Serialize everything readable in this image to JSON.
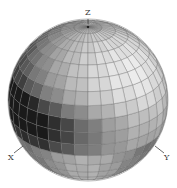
{
  "figure": {
    "type": "shaded-sphere",
    "axes": [
      {
        "name": "z",
        "label": "Z"
      },
      {
        "name": "x",
        "label": "X"
      },
      {
        "name": "y",
        "label": "Y"
      }
    ],
    "grid": {
      "latitude_bands": 18,
      "longitude_segments": 36
    },
    "colors": {
      "background": "#ffffff",
      "grid_line": "#6b6b6b",
      "axis_line": "#444444",
      "dark": "#1e1e1e",
      "light": "#f4f4f4"
    }
  }
}
